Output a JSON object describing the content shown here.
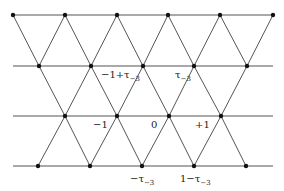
{
  "diagram": {
    "type": "triangular-lattice",
    "colors": {
      "line": "#555555",
      "point": "#111111",
      "text": "#222222",
      "background": "#ffffff"
    },
    "horizontal_lines": [
      {
        "y": 15,
        "x1": 13,
        "x2": 273
      },
      {
        "y": 66,
        "x1": 13,
        "x2": 273
      },
      {
        "y": 116,
        "x1": 13,
        "x2": 273
      },
      {
        "y": 166,
        "x1": 13,
        "x2": 273
      }
    ],
    "rows": [
      {
        "y": 15,
        "points_x": [
          13,
          65,
          117,
          168,
          220,
          273
        ]
      },
      {
        "y": 66,
        "points_x": [
          39,
          91,
          143,
          194,
          247
        ]
      },
      {
        "y": 116,
        "points_x": [
          65,
          117,
          169,
          221
        ]
      },
      {
        "y": 166,
        "points_x": [
          38,
          90,
          142,
          194,
          246
        ]
      }
    ],
    "diagonals": [
      [
        13,
        15,
        39,
        66
      ],
      [
        65,
        15,
        39,
        66
      ],
      [
        65,
        15,
        91,
        66
      ],
      [
        117,
        15,
        91,
        66
      ],
      [
        117,
        15,
        143,
        66
      ],
      [
        168,
        15,
        143,
        66
      ],
      [
        168,
        15,
        194,
        66
      ],
      [
        220,
        15,
        194,
        66
      ],
      [
        220,
        15,
        247,
        66
      ],
      [
        273,
        15,
        247,
        66
      ],
      [
        39,
        66,
        65,
        116
      ],
      [
        91,
        66,
        65,
        116
      ],
      [
        91,
        66,
        117,
        116
      ],
      [
        143,
        66,
        117,
        116
      ],
      [
        143,
        66,
        169,
        116
      ],
      [
        194,
        66,
        169,
        116
      ],
      [
        194,
        66,
        221,
        116
      ],
      [
        247,
        66,
        221,
        116
      ],
      [
        65,
        116,
        38,
        166
      ],
      [
        65,
        116,
        90,
        166
      ],
      [
        117,
        116,
        90,
        166
      ],
      [
        117,
        116,
        142,
        166
      ],
      [
        169,
        116,
        142,
        166
      ],
      [
        169,
        116,
        194,
        166
      ],
      [
        221,
        116,
        194,
        166
      ],
      [
        221,
        116,
        246,
        166
      ]
    ],
    "labels": [
      {
        "id": "minus-one-plus-tau",
        "main": "−1+τ",
        "sub": "−3",
        "x": 101,
        "y": 78
      },
      {
        "id": "tau",
        "main": "τ",
        "sub": "−3",
        "x": 175,
        "y": 78
      },
      {
        "id": "minus-one",
        "main": "−1",
        "sub": "",
        "x": 93,
        "y": 128
      },
      {
        "id": "zero",
        "main": "0",
        "sub": "",
        "x": 151,
        "y": 128
      },
      {
        "id": "plus-one",
        "main": "+1",
        "sub": "",
        "x": 195,
        "y": 128
      },
      {
        "id": "minus-tau",
        "main": "−τ",
        "sub": "−3",
        "x": 130,
        "y": 182
      },
      {
        "id": "one-minus-tau",
        "main": "1−τ",
        "sub": "−3",
        "x": 180,
        "y": 182
      }
    ]
  }
}
